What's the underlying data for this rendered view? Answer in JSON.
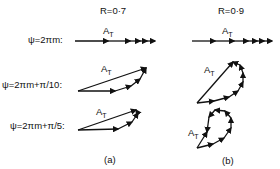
{
  "figure": {
    "columns": [
      {
        "id": "a",
        "header": "R=0·7",
        "caption": "(a)"
      },
      {
        "id": "b",
        "header": "R=0·9",
        "caption": "(b)"
      }
    ],
    "rows": [
      {
        "label": "ψ=2πm:"
      },
      {
        "label": "ψ=2πm+π/10:"
      },
      {
        "label": "ψ=2πm+π/5:"
      }
    ],
    "resultant_label": {
      "main": "A",
      "sub": "T"
    },
    "colors": {
      "ink": "#111111",
      "background": "#ffffff"
    }
  }
}
